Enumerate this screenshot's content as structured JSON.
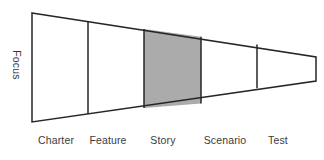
{
  "diagram": {
    "type": "funnel",
    "title": "",
    "axis_label": "Focus",
    "background_color": "#ffffff",
    "outline_color": "#262626",
    "highlight_fill": "#ababab",
    "segment_fill": "#ffffff",
    "text_color": "#3b3b3b",
    "stages": [
      {
        "label": "Charter",
        "highlighted": false,
        "fill": "#ffffff",
        "label_center_x": 56,
        "x_left": 32,
        "x_right": 88
      },
      {
        "label": "Feature",
        "highlighted": false,
        "fill": "#ffffff",
        "label_center_x": 108,
        "x_left": 88,
        "x_right": 144
      },
      {
        "label": "Story",
        "highlighted": true,
        "fill": "#ababab",
        "label_center_x": 163,
        "x_left": 144,
        "x_right": 201
      },
      {
        "label": "Scenario",
        "highlighted": false,
        "fill": "#ffffff",
        "label_center_x": 225,
        "x_left": 201,
        "x_right": 257
      },
      {
        "label": "Test",
        "highlighted": false,
        "fill": "#ffffff",
        "label_center_x": 278,
        "x_left": 257,
        "x_right": 316
      }
    ],
    "geometry": {
      "top_left": {
        "x": 32,
        "y": 13
      },
      "bottom_left": {
        "x": 32,
        "y": 122
      },
      "top_right": {
        "x": 316,
        "y": 57
      },
      "bottom_right": {
        "x": 316,
        "y": 81
      },
      "divider_x": [
        88,
        144,
        201,
        257
      ],
      "label_baseline_y": 146
    }
  }
}
